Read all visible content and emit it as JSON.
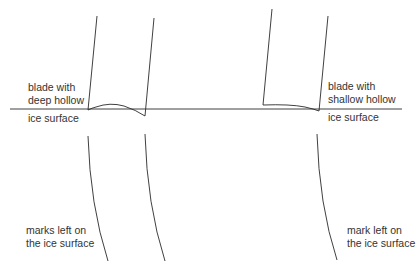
{
  "diagram": {
    "colors": {
      "line": "#2a2a2a",
      "text": "#333333",
      "background": "#ffffff"
    },
    "labels": {
      "left_blade_line1": "blade with",
      "left_blade_line2": "deep hollow",
      "left_ice": "ice surface",
      "right_blade_line1": "blade with",
      "right_blade_line2": "shallow hollow",
      "right_ice": "ice surface",
      "left_marks_line1": "marks left on",
      "left_marks_line2": "the ice surface",
      "right_mark_line1": "mark left on",
      "right_mark_line2": "the ice surface"
    }
  }
}
